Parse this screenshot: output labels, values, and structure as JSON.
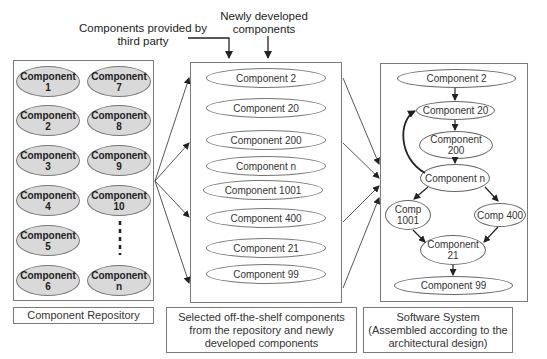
{
  "annotations": {
    "third_party": "Components provided by third party",
    "newly_developed": "Newly developed components"
  },
  "repository": {
    "caption": "Component Repository",
    "components": [
      "Component 1",
      "Component 2",
      "Component 3",
      "Component 4",
      "Component 5",
      "Component 6",
      "Component 7",
      "Component 8",
      "Component 9",
      "Component 10",
      "Component n"
    ],
    "ellipsis": "⋮"
  },
  "selected": {
    "caption": "Selected off-the-shelf components from the repository and newly developed components",
    "components": [
      "Component 2",
      "Component 20",
      "Component 200",
      "Component n",
      "Component 1001",
      "Component 400",
      "Component 21",
      "Component 99"
    ]
  },
  "system": {
    "caption": "Software System (Assembled according to the architectural design)",
    "nodes": {
      "c2": "Component 2",
      "c20": "Component 20",
      "c200": "Component 200",
      "cn": "Component n",
      "c1001": "Comp 1001",
      "c400": "Comp 400",
      "c21": "Component 21",
      "c99": "Component 99"
    },
    "edges": [
      [
        "c2",
        "c20"
      ],
      [
        "c20",
        "c200"
      ],
      [
        "c200",
        "cn"
      ],
      [
        "cn",
        "c20"
      ],
      [
        "cn",
        "c1001"
      ],
      [
        "cn",
        "c400"
      ],
      [
        "c1001",
        "c21"
      ],
      [
        "c400",
        "c21"
      ],
      [
        "c21",
        "c99"
      ]
    ]
  },
  "colors": {
    "repo_fill": "#d9d9d9",
    "stroke": "#777777",
    "arrow": "#333333"
  }
}
